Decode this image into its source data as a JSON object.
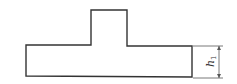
{
  "diagram": {
    "type": "T-shaped cross-section",
    "dimensions": [
      {
        "label": "h",
        "subscript": "1",
        "describes": "height of lower base block"
      }
    ],
    "colors": {
      "outline": "#333333",
      "dimension": "#555555",
      "background": "#ffffff"
    }
  }
}
